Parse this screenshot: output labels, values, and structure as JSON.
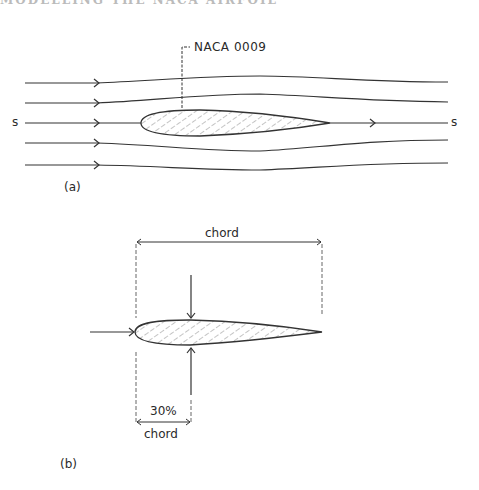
{
  "header": {
    "cropped_heading": "MODELLING THE NACA AIRFOIL"
  },
  "panel_a": {
    "airfoil_label": "NACA  0009",
    "stagnation_left": "s",
    "stagnation_right": "s",
    "caption": "(a)"
  },
  "panel_b": {
    "chord_label": "chord",
    "position_pct": "30%",
    "position_chord": "chord",
    "caption": "(b)"
  },
  "colors": {
    "line": "#333333",
    "hatch": "#8a8a8a",
    "background": "#ffffff"
  }
}
